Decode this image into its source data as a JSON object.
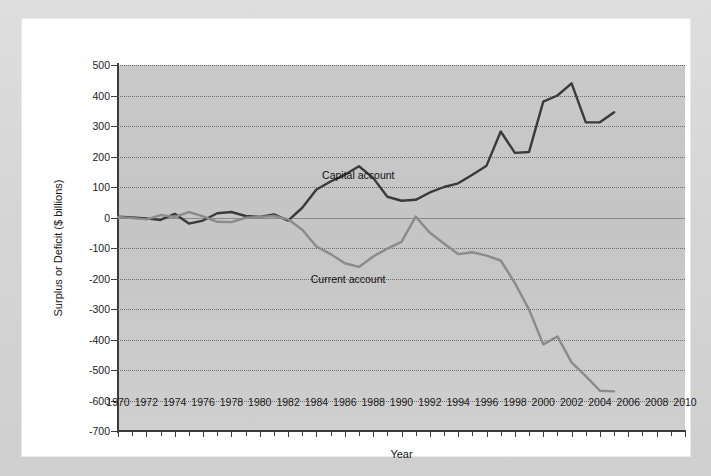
{
  "chart_data": {
    "type": "line",
    "title": "",
    "xlabel": "Year",
    "ylabel": "Surplus or Deficit ($ billions)",
    "xlim": [
      1970,
      2010
    ],
    "ylim": [
      -700,
      500
    ],
    "ytick_step": 100,
    "xtick_step": 2,
    "minor_xticks": true,
    "grid": true,
    "legend_position": "inline-annotation",
    "yticks": [
      500,
      400,
      300,
      200,
      100,
      0,
      -100,
      -200,
      -300,
      -400,
      -500,
      -600,
      -700
    ],
    "ytick_labels": [
      "500",
      "400",
      "300",
      "200",
      "100",
      "0",
      "-100",
      "-200",
      "-300",
      "-400",
      "-500",
      "-600",
      "-700"
    ],
    "xticks": [
      1970,
      1972,
      1974,
      1976,
      1978,
      1980,
      1982,
      1984,
      1986,
      1988,
      1990,
      1992,
      1994,
      1996,
      1998,
      2000,
      2002,
      2004,
      2006,
      2008,
      2010
    ],
    "xtick_labels": [
      "1970",
      "1972",
      "1974",
      "1976",
      "1978",
      "1980",
      "1982",
      "1984",
      "1986",
      "1988",
      "1990",
      "1992",
      "1994",
      "1996",
      "1998",
      "2000",
      "2002",
      "2004",
      "2006",
      "2008",
      "2010"
    ],
    "x": [
      1970,
      1971,
      1972,
      1973,
      1974,
      1975,
      1976,
      1977,
      1978,
      1979,
      1980,
      1981,
      1982,
      1983,
      1984,
      1985,
      1986,
      1987,
      1988,
      1989,
      1990,
      1991,
      1992,
      1993,
      1994,
      1995,
      1996,
      1997,
      1998,
      1999,
      2000,
      2001,
      2002,
      2003,
      2004,
      2005
    ],
    "series": [
      {
        "name": "Capital account",
        "color": "#3a3a3a",
        "values": [
          3,
          0,
          -3,
          -8,
          12,
          -20,
          -10,
          14,
          18,
          5,
          2,
          10,
          -10,
          32,
          92,
          118,
          140,
          168,
          130,
          68,
          55,
          58,
          82,
          100,
          112,
          140,
          170,
          282,
          212,
          215,
          380,
          400,
          440,
          312,
          312,
          345
        ]
      },
      {
        "name": "Current account",
        "color": "#8b8b8b",
        "values": [
          2,
          -2,
          -6,
          8,
          2,
          18,
          4,
          -14,
          -15,
          -1,
          2,
          5,
          -6,
          -40,
          -95,
          -120,
          -150,
          -162,
          -128,
          -102,
          -80,
          3,
          -50,
          -85,
          -120,
          -114,
          -125,
          -141,
          -215,
          -302,
          -416,
          -390,
          -475,
          -520,
          -568,
          -570
        ]
      }
    ],
    "annotations": [
      {
        "text": "Capital account",
        "x": 1984.4,
        "y": 135
      },
      {
        "text": "Current account",
        "x": 1983.6,
        "y": -205
      }
    ]
  }
}
